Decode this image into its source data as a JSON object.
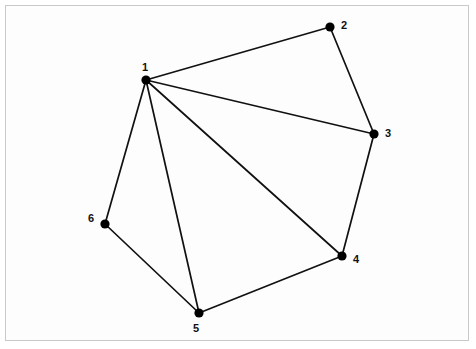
{
  "figure": {
    "kind": "graph-diagram",
    "background_color": "#fdfdfd",
    "page_background_color": "#ffffff",
    "border_color": "#c9c9c9",
    "vertex_color": "#000000",
    "edge_color": "#111111",
    "label_color": "#111111"
  },
  "chart_data": {
    "type": "scatter",
    "title": "",
    "subtitle": "",
    "xlabel": "",
    "ylabel": "",
    "grid": false,
    "legend": "none",
    "axis_visible": false,
    "xlim": [
      0,
      476
    ],
    "ylim": [
      0,
      349
    ],
    "graph": {
      "directed": false,
      "node_count": 6,
      "edge_count": 9,
      "nodes": [
        {
          "id": "1",
          "label": "1",
          "x": 146,
          "y": 80,
          "label_x": 145,
          "label_y": 67,
          "radius": 4.6
        },
        {
          "id": "2",
          "label": "2",
          "x": 330,
          "y": 27,
          "label_x": 344,
          "label_y": 25,
          "radius": 4.6
        },
        {
          "id": "3",
          "label": "3",
          "x": 374,
          "y": 134,
          "label_x": 388,
          "label_y": 133,
          "radius": 4.6
        },
        {
          "id": "4",
          "label": "4",
          "x": 342,
          "y": 256,
          "label_x": 356,
          "label_y": 259,
          "radius": 4.6
        },
        {
          "id": "5",
          "label": "5",
          "x": 199,
          "y": 313,
          "label_x": 196,
          "label_y": 328,
          "radius": 4.6
        },
        {
          "id": "6",
          "label": "6",
          "x": 105,
          "y": 224,
          "label_x": 91,
          "label_y": 218,
          "radius": 4.6
        }
      ],
      "edges": [
        {
          "id": "edge-1-2",
          "source": "1",
          "target": "2"
        },
        {
          "id": "edge-1-3",
          "source": "1",
          "target": "3"
        },
        {
          "id": "edge-1-4",
          "source": "1",
          "target": "4"
        },
        {
          "id": "edge-1-5",
          "source": "1",
          "target": "5"
        },
        {
          "id": "edge-1-6",
          "source": "1",
          "target": "6"
        },
        {
          "id": "edge-2-3",
          "source": "2",
          "target": "3"
        },
        {
          "id": "edge-3-4",
          "source": "3",
          "target": "4"
        },
        {
          "id": "edge-4-5",
          "source": "4",
          "target": "5"
        },
        {
          "id": "edge-5-6",
          "source": "5",
          "target": "6"
        }
      ],
      "adjacency_labels": [
        "1-2",
        "1-3",
        "1-4",
        "1-5",
        "1-6",
        "2-3",
        "3-4",
        "4-5",
        "5-6"
      ]
    }
  }
}
